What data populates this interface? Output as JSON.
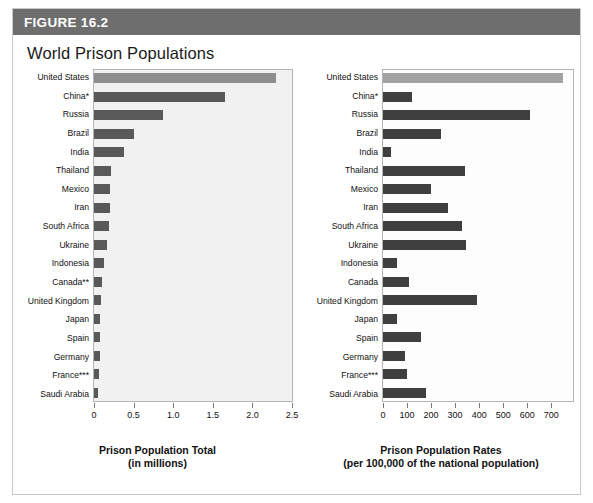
{
  "figure": {
    "label": "FIGURE 16.2",
    "title": "World Prison Populations",
    "header_bg": "#6e6e6e",
    "card_bg": "#ffffff",
    "border_color": "#c9c9c9"
  },
  "colors": {
    "bar_dark": "#3f3f3f",
    "bar_dark_left": "#595959",
    "bar_highlight_left": "#8e8e8e",
    "bar_highlight_right": "#a3a3a3",
    "plot_bg_left": "#f1f1f1",
    "plot_bg_right": "#fdfdfd",
    "axis": "#777777",
    "text": "#111111"
  },
  "chart_data": [
    {
      "type": "bar",
      "orientation": "horizontal",
      "id": "prison-population-total",
      "title": "",
      "xlabel": "Prison Population Total",
      "xlabel_sub": "(in millions)",
      "ylabel": "",
      "xlim": [
        0,
        2.5
      ],
      "xticks": [
        0,
        0.5,
        1.0,
        1.5,
        2.0,
        2.5
      ],
      "xticklabels": [
        "0",
        "0.5",
        "1.0",
        "1.5",
        "2.0",
        "2.5"
      ],
      "grid": false,
      "legend": "none",
      "highlight_index": 0,
      "categories": [
        "United States",
        "China*",
        "Russia",
        "Brazil",
        "India",
        "Thailand",
        "Mexico",
        "Iran",
        "South Africa",
        "Ukraine",
        "Indonesia",
        "Canada**",
        "United Kingdom",
        "Japan",
        "Spain",
        "Germany",
        "France***",
        "Saudi Arabia"
      ],
      "values": [
        2.3,
        1.65,
        0.87,
        0.5,
        0.38,
        0.21,
        0.2,
        0.2,
        0.19,
        0.16,
        0.12,
        0.1,
        0.09,
        0.08,
        0.07,
        0.07,
        0.06,
        0.05
      ]
    },
    {
      "type": "bar",
      "orientation": "horizontal",
      "id": "prison-population-rates",
      "title": "",
      "xlabel": "Prison Population Rates",
      "xlabel_sub": "(per 100,000 of the national population)",
      "ylabel": "",
      "xlim": [
        0,
        790
      ],
      "xticks": [
        0,
        100,
        200,
        300,
        400,
        500,
        600,
        700
      ],
      "xticklabels": [
        "0",
        "100",
        "200",
        "300",
        "400",
        "500",
        "600",
        "700"
      ],
      "grid": false,
      "legend": "none",
      "highlight_index": 0,
      "categories": [
        "United States",
        "China*",
        "Russia",
        "Brazil",
        "India",
        "Thailand",
        "Mexico",
        "Iran",
        "South Africa",
        "Ukraine",
        "Indonesia",
        "Canada",
        "United Kingdom",
        "Japan",
        "Spain",
        "Germany",
        "France***",
        "Saudi Arabia"
      ],
      "values": [
        750,
        120,
        610,
        240,
        35,
        340,
        200,
        270,
        330,
        345,
        60,
        110,
        390,
        60,
        160,
        90,
        100,
        180
      ]
    }
  ]
}
